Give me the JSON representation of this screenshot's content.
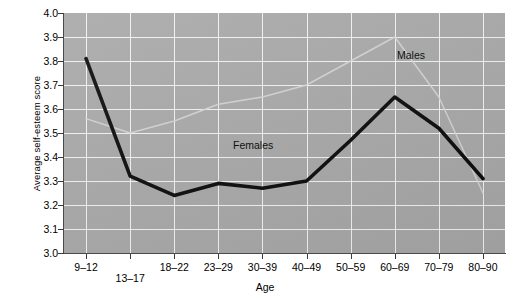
{
  "chart_data": {
    "type": "line",
    "title": "",
    "xlabel": "Age",
    "ylabel": "Average self-esteem score",
    "categories": [
      "9–12",
      "13–17",
      "18–22",
      "23–29",
      "30–39",
      "40–49",
      "50–59",
      "60–69",
      "70–79",
      "80–90"
    ],
    "ylim": [
      3.0,
      4.0
    ],
    "ytick_labels": [
      "4.0",
      "3.9",
      "3.8",
      "3.7",
      "3.6",
      "3.5",
      "3.4",
      "3.3",
      "3.2",
      "3.1",
      "3.0"
    ],
    "ytick_values": [
      4.0,
      3.9,
      3.8,
      3.7,
      3.6,
      3.5,
      3.4,
      3.3,
      3.2,
      3.1,
      3.0
    ],
    "grid": true,
    "legend_position": "inline-annotations",
    "series": [
      {
        "name": "Females",
        "color": "#0a0a0a",
        "style": "thick-dark",
        "values": [
          3.81,
          3.32,
          3.24,
          3.29,
          3.27,
          3.3,
          3.47,
          3.65,
          3.52,
          3.31
        ]
      },
      {
        "name": "Males",
        "color": "#d6d6d6",
        "style": "thin-light",
        "values": [
          3.56,
          3.5,
          3.55,
          3.62,
          3.65,
          3.7,
          3.8,
          3.9,
          3.65,
          3.25
        ]
      }
    ],
    "annotations": [
      {
        "text": "Males",
        "series": "Males"
      },
      {
        "text": "Females",
        "series": "Females"
      }
    ]
  },
  "axes": {
    "x_title": "Age",
    "y_title": "Average self-esteem score"
  }
}
